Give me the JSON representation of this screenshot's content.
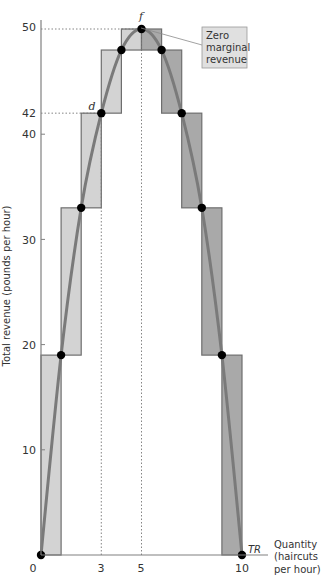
{
  "chart_data": {
    "type": "bar",
    "title": "",
    "xlabel": "Quantity (haircuts per hour)",
    "ylabel": "Total revenue (pounds per hour)",
    "x": [
      0,
      1,
      2,
      3,
      4,
      5,
      6,
      7,
      8,
      9,
      10
    ],
    "series": [
      {
        "name": "TR",
        "kind": "line",
        "values": [
          0,
          19,
          33,
          42,
          48,
          50,
          48,
          42,
          33,
          19,
          0
        ]
      },
      {
        "name": "Marginal revenue steps (rising)",
        "kind": "bar",
        "color": "#d3d3d3",
        "ranges": [
          [
            0,
            1,
            0,
            19
          ],
          [
            1,
            2,
            19,
            33
          ],
          [
            2,
            3,
            33,
            42
          ],
          [
            3,
            4,
            42,
            48
          ],
          [
            4,
            5,
            48,
            50
          ]
        ]
      },
      {
        "name": "Marginal revenue steps (falling)",
        "kind": "bar",
        "color": "#a9a9a9",
        "ranges": [
          [
            5,
            6,
            48,
            50
          ],
          [
            6,
            7,
            42,
            48
          ],
          [
            7,
            8,
            33,
            42
          ],
          [
            8,
            9,
            19,
            33
          ],
          [
            9,
            10,
            0,
            19
          ]
        ]
      }
    ],
    "xlim": [
      0,
      10.6
    ],
    "ylim": [
      0,
      52
    ],
    "x_ticks": [
      "0",
      "3",
      "5",
      "10"
    ],
    "y_ticks": [
      "10",
      "20",
      "30",
      "40",
      "42",
      "50"
    ],
    "grid": false,
    "legend": null,
    "annotations": [
      {
        "text": "d",
        "x": 3,
        "y": 42
      },
      {
        "text": "f",
        "x": 5,
        "y": 50
      },
      {
        "text": "TR",
        "x": 10,
        "y": 0
      },
      {
        "text": "Zero marginal revenue",
        "x": 5,
        "y": 50,
        "type": "callout"
      }
    ],
    "guides": [
      {
        "type": "dotted",
        "from": [
          0,
          50
        ],
        "to": [
          5,
          50
        ]
      },
      {
        "type": "dotted",
        "from": [
          0,
          42
        ],
        "to": [
          3,
          42
        ]
      },
      {
        "type": "dotted",
        "from": [
          3,
          0
        ],
        "to": [
          3,
          42
        ]
      },
      {
        "type": "dotted",
        "from": [
          5,
          0
        ],
        "to": [
          5,
          50
        ]
      }
    ]
  },
  "labels": {
    "y_axis": "Total revenue (pounds per hour)",
    "x_axis_line1": "Quantity",
    "x_axis_line2": "(haircuts",
    "x_axis_line3": "per hour)",
    "origin": "0",
    "x_tick_3": "3",
    "x_tick_5": "5",
    "x_tick_10": "10",
    "y_tick_10": "10",
    "y_tick_20": "20",
    "y_tick_30": "30",
    "y_tick_40": "40",
    "y_tick_42": "42",
    "y_tick_50": "50",
    "point_d": "d",
    "point_f": "f",
    "curve_tr": "TR",
    "callout_line1": "Zero",
    "callout_line2": "marginal",
    "callout_line3": "revenue"
  },
  "colors": {
    "rising_fill": "#d3d3d3",
    "falling_fill": "#a9a9a9",
    "bar_stroke": "#6e6e6e",
    "curve": "#7a7a7a",
    "point": "#000000",
    "axis": "#808080",
    "callout_fill": "#e0e0e0"
  }
}
